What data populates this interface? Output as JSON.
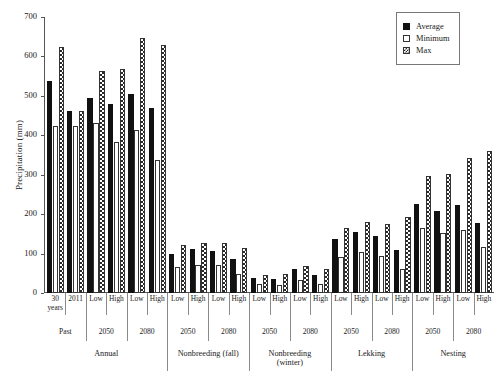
{
  "chart_data": {
    "type": "bar",
    "title": "",
    "xlabel": "",
    "ylabel": "Precipitation (mm)",
    "ylim": [
      0,
      700
    ],
    "yticks": [
      0,
      100,
      200,
      300,
      400,
      500,
      600,
      700
    ],
    "grid": false,
    "legend_position": "top-right",
    "legend": [
      "Average",
      "Minimum",
      "Max"
    ],
    "series": [
      {
        "name": "Average",
        "color": "#111111",
        "values": [
          538,
          461,
          494,
          480,
          506,
          469,
          100,
          112,
          107,
          86,
          37,
          36,
          60,
          45,
          138,
          155,
          145,
          110,
          227,
          207,
          224,
          178
        ]
      },
      {
        "name": "Minimum",
        "color": "#ffffff",
        "values": [
          424,
          423,
          430,
          382,
          413,
          338,
          66,
          70,
          72,
          47,
          23,
          21,
          33,
          23,
          92,
          103,
          93,
          61,
          165,
          152,
          160,
          117
        ]
      },
      {
        "name": "Max",
        "color": "#2a2a2a",
        "values": [
          624,
          462,
          562,
          569,
          646,
          628,
          122,
          127,
          126,
          114,
          46,
          47,
          69,
          61,
          164,
          180,
          175,
          192,
          296,
          302,
          343,
          359
        ]
      }
    ],
    "categories": [
      "30 years",
      "2011",
      "Low",
      "High",
      "Low",
      "High",
      "Low",
      "High",
      "Low",
      "High",
      "Low",
      "High",
      "Low",
      "High",
      "Low",
      "High",
      "Low",
      "High",
      "Low",
      "High",
      "Low",
      "High"
    ],
    "axis_levels": {
      "sub": [
        {
          "label": "30\nyears",
          "span": 1
        },
        {
          "label": "2011",
          "span": 1
        },
        {
          "label": "Low",
          "span": 1
        },
        {
          "label": "High",
          "span": 1
        },
        {
          "label": "Low",
          "span": 1
        },
        {
          "label": "High",
          "span": 1
        },
        {
          "label": "Low",
          "span": 1
        },
        {
          "label": "High",
          "span": 1
        },
        {
          "label": "Low",
          "span": 1
        },
        {
          "label": "High",
          "span": 1
        },
        {
          "label": "Low",
          "span": 1
        },
        {
          "label": "High",
          "span": 1
        },
        {
          "label": "Low",
          "span": 1
        },
        {
          "label": "High",
          "span": 1
        },
        {
          "label": "Low",
          "span": 1
        },
        {
          "label": "High",
          "span": 1
        },
        {
          "label": "Low",
          "span": 1
        },
        {
          "label": "High",
          "span": 1
        },
        {
          "label": "Low",
          "span": 1
        },
        {
          "label": "High",
          "span": 1
        },
        {
          "label": "Low",
          "span": 1
        },
        {
          "label": "High",
          "span": 1
        }
      ],
      "era": [
        {
          "label": "Past",
          "span": 2
        },
        {
          "label": "2050",
          "span": 2
        },
        {
          "label": "2080",
          "span": 2
        },
        {
          "label": "2050",
          "span": 2
        },
        {
          "label": "2080",
          "span": 2
        },
        {
          "label": "2050",
          "span": 2
        },
        {
          "label": "2080",
          "span": 2
        },
        {
          "label": "2050",
          "span": 2
        },
        {
          "label": "2080",
          "span": 2
        },
        {
          "label": "2050",
          "span": 2
        },
        {
          "label": "2080",
          "span": 2
        }
      ],
      "season": [
        {
          "label": "Annual",
          "span": 6
        },
        {
          "label": "Nonbreeding (fall)",
          "span": 4
        },
        {
          "label": "Nonbreeding\n(winter)",
          "span": 4
        },
        {
          "label": "Lekking",
          "span": 4
        },
        {
          "label": "Nesting",
          "span": 4
        }
      ]
    }
  }
}
